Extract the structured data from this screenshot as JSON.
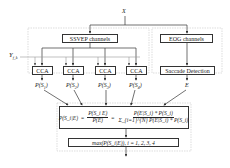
{
  "diagram": {
    "input_label": "X",
    "reference_label": "Y",
    "reference_subscript": "f_k",
    "ssvep_box": "SSVEP channels",
    "eog_box": "EOG channels",
    "cca_boxes": [
      "CCA",
      "CCA",
      "CCA",
      "CCA"
    ],
    "saccade_box": "Saccade Detection",
    "cca_outputs": [
      {
        "p": "P(S",
        "sub": "1",
        "close": ")"
      },
      {
        "p": "P(S",
        "sub": "2",
        "close": ")"
      },
      {
        "p": "P(S",
        "sub": "3",
        "close": ")"
      },
      {
        "p": "P(S",
        "sub": "4",
        "close": ")"
      }
    ],
    "eog_output": "E",
    "formula": {
      "lhs": "P(S_i|E)",
      "eq1": "=",
      "frac1_num": "P(S_i E)",
      "frac1_den": "P(E)",
      "eq2": "=",
      "frac2_num": "P(E|S_i) * P(S_i)",
      "frac2_den": "Σ_{i=1}^{N} P(E|S_i) * P(S_i)"
    },
    "decision": "max(P(S_i|E)), i = 1, 2, 3, 4"
  },
  "colors": {
    "line": "#333333",
    "dashed": "#bbbbbb",
    "background": "#ffffff"
  }
}
